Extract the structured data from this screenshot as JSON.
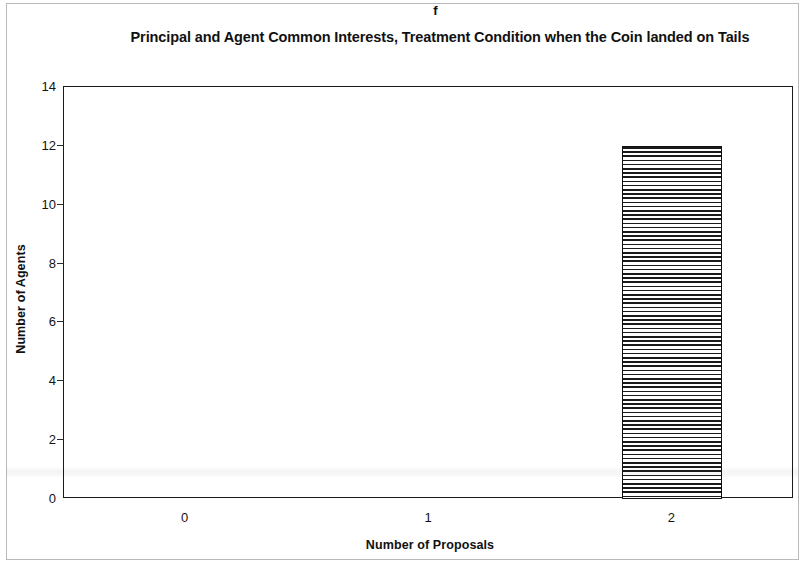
{
  "panel": {
    "label": "f"
  },
  "chart_data": {
    "type": "bar",
    "title": "Principal and Agent Common Interests, Treatment Condition when the Coin landed on Tails",
    "panel_label": "f",
    "xlabel": "Number of Proposals",
    "ylabel": "Number of Agents",
    "categories": [
      "0",
      "1",
      "2"
    ],
    "values": [
      0,
      0,
      12
    ],
    "ylim": [
      0,
      14
    ],
    "yticks": [
      0,
      2,
      4,
      6,
      8,
      10,
      12,
      14
    ],
    "ytick_labels": [
      "0",
      "2",
      "4",
      "6",
      "8",
      "10",
      "12",
      "14"
    ],
    "grid": false,
    "legend": null,
    "bar_style": "horizontal-hatch",
    "colors": {
      "bar_fill": "#ffffff",
      "bar_hatch": "#1b1b1b",
      "bar_edge": "#111111",
      "axis": "#1a1a1a",
      "text": "#111111",
      "page_border": "#b9b9bd"
    }
  }
}
